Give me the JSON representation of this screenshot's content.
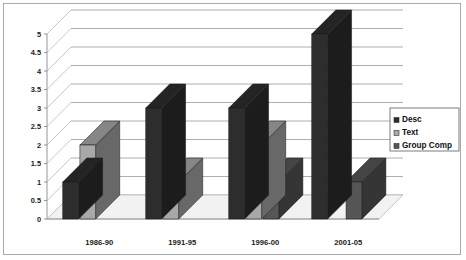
{
  "chart_data": {
    "type": "bar",
    "title": "",
    "subtitle": "",
    "xlabel": "",
    "ylabel": "",
    "categories": [
      "1986-90",
      "1991-95",
      "1996-00",
      "2001-05"
    ],
    "series": [
      {
        "name": "Desc",
        "values": [
          1,
          3,
          3,
          5
        ],
        "color": "#2d2d2d"
      },
      {
        "name": "Text",
        "values": [
          2,
          1,
          2,
          0
        ],
        "color": "#a8a8a8"
      },
      {
        "name": "Group Comp",
        "values": [
          0,
          0,
          1,
          1
        ],
        "color": "#565656"
      }
    ],
    "ylim": [
      0,
      5
    ],
    "ystep": 0.5,
    "ytick_labels": [
      "0",
      "0.5",
      "1",
      "1.5",
      "2",
      "2.5",
      "3",
      "3.5",
      "4",
      "4.5",
      "5"
    ],
    "grid": true,
    "grid_axis": "y",
    "legend_position": "right",
    "style": "3d-clustered-column",
    "palette": [
      "#2d2d2d",
      "#a8a8a8",
      "#565656"
    ]
  },
  "legend": {
    "entries": [
      {
        "label": "Desc",
        "swatch": "#2d2d2d"
      },
      {
        "label": "Text",
        "swatch": "#a8a8a8"
      },
      {
        "label": "Group Comp",
        "swatch": "#565656"
      }
    ]
  },
  "axes": {
    "y_ticks": [
      "5",
      "4.5",
      "4",
      "3.5",
      "3",
      "2.5",
      "2",
      "1.5",
      "1",
      "0.5",
      "0"
    ],
    "x_categories": [
      "1986-90",
      "1991-95",
      "1996-00",
      "2001-05"
    ]
  },
  "colors": {
    "frame_border": "#a9a9a9",
    "gridline": "#9a9a9a",
    "plot_background": "#ffffff",
    "floor": "#f2f2f2",
    "series_desc": "#2d2d2d",
    "series_text": "#a8a8a8",
    "series_group_comp": "#565656"
  }
}
